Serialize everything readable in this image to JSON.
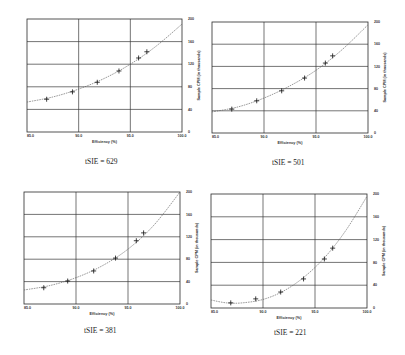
{
  "chart_data": [
    {
      "type": "scatter",
      "title": "tSIE = 629",
      "xlabel": "Efficiency (%)",
      "ylabel": "Sample CPM (in thousands)",
      "xlim": [
        85,
        100
      ],
      "ylim": [
        0,
        200
      ],
      "x_ticks": [
        "85.0",
        "90.0",
        "95.0",
        "100.0"
      ],
      "y_ticks": [
        "0",
        "40",
        "80",
        "120",
        "160",
        "200"
      ],
      "grid": true,
      "points": {
        "x": [
          86.9,
          89.4,
          91.8,
          93.9,
          95.8,
          96.6
        ],
        "y": [
          58,
          71,
          88,
          108,
          131,
          142
        ]
      },
      "fit_curve": {
        "x": [
          85,
          87.5,
          90,
          92.5,
          95,
          97.5,
          100
        ],
        "y": [
          53,
          62,
          76,
          95,
          120,
          152,
          191
        ]
      }
    },
    {
      "type": "scatter",
      "title": "tSIE = 501",
      "xlabel": "Efficiency (%)",
      "ylabel": "Sample CPM (in thousands)",
      "xlim": [
        85,
        100
      ],
      "ylim": [
        0,
        200
      ],
      "x_ticks": [
        "85.0",
        "90.0",
        "95.0",
        "100.0"
      ],
      "y_ticks": [
        "0",
        "40",
        "80",
        "120",
        "160",
        "200"
      ],
      "grid": true,
      "points": {
        "x": [
          86.9,
          89.3,
          91.7,
          93.9,
          95.9,
          96.6
        ],
        "y": [
          43,
          58,
          76,
          99,
          126,
          139
        ]
      },
      "fit_curve": {
        "x": [
          85,
          87.5,
          90,
          92.5,
          95,
          97.5,
          100
        ],
        "y": [
          38,
          47,
          63,
          85,
          113,
          150,
          195
        ]
      }
    },
    {
      "type": "scatter",
      "title": "tSIE = 381",
      "xlabel": "Efficiency (%)",
      "ylabel": "Sample CPM (in thousands)",
      "xlim": [
        85,
        100
      ],
      "ylim": [
        0,
        200
      ],
      "x_ticks": [
        "85.0",
        "90.0",
        "95.0",
        "100.0"
      ],
      "y_ticks": [
        "0",
        "40",
        "80",
        "120",
        "160",
        "200"
      ],
      "grid": true,
      "points": {
        "x": [
          86.9,
          89.2,
          91.7,
          93.8,
          95.8,
          96.5
        ],
        "y": [
          29,
          41,
          59,
          82,
          113,
          127
        ]
      },
      "fit_curve": {
        "x": [
          85,
          87.5,
          90,
          92.5,
          95,
          97.5,
          100
        ],
        "y": [
          25,
          33,
          47,
          68,
          98,
          141,
          200
        ]
      }
    },
    {
      "type": "scatter",
      "title": "tSIE = 221",
      "xlabel": "Efficiency (%)",
      "ylabel": "Sample CPM (in thousands)",
      "xlim": [
        85,
        100
      ],
      "ylim": [
        0,
        200
      ],
      "x_ticks": [
        "85.0",
        "90.0",
        "95.0",
        "100.0"
      ],
      "y_ticks": [
        "0",
        "40",
        "80",
        "120",
        "160",
        "200"
      ],
      "grid": true,
      "points": {
        "x": [
          86.9,
          89.3,
          91.7,
          93.9,
          95.9,
          96.7
        ],
        "y": [
          9,
          16,
          28,
          51,
          86,
          105
        ]
      },
      "fit_curve": {
        "x": [
          85,
          86.5,
          88,
          90,
          92,
          94,
          96,
          98,
          100
        ],
        "y": [
          14,
          9,
          9,
          15,
          30,
          55,
          90,
          137,
          196
        ]
      }
    }
  ],
  "layout": [
    {
      "plot": {
        "left": 27,
        "top": 19,
        "width": 155,
        "height": 113
      },
      "caption": {
        "left": 85,
        "top": 157
      }
    },
    {
      "plot": {
        "left": 212,
        "top": 22,
        "width": 156,
        "height": 111
      },
      "caption": {
        "left": 272,
        "top": 158
      }
    },
    {
      "plot": {
        "left": 24,
        "top": 192,
        "width": 156,
        "height": 112
      },
      "caption": {
        "left": 84,
        "top": 326
      }
    },
    {
      "plot": {
        "left": 211,
        "top": 194,
        "width": 156,
        "height": 114
      },
      "caption": {
        "left": 274,
        "top": 328
      }
    }
  ],
  "colors": {
    "grid": "#3a3a3a",
    "frame": "#2a2a2a",
    "marker": "#111111",
    "curve": "#555555"
  }
}
